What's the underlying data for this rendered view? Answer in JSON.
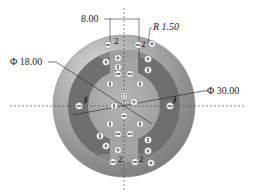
{
  "diagram": {
    "type": "technical-drawing",
    "colors": {
      "outer_disc": "#9a9a9a",
      "outer_disc_highlight": "#d8d8d8",
      "annulus_dark": "#6e6e6e",
      "inner_disc": "#a8a8a8",
      "slot": "#a8a8a8",
      "centerline": "#555555",
      "dimension_line": "#333333",
      "marker_fill": "#f2f2f2"
    },
    "dimensions": {
      "slot_width": "8.00",
      "fillet_radius": "R 1.50",
      "inner_diameter": "Φ 18.00",
      "outer_diameter": "Φ 30.00"
    },
    "labels": {
      "left_region": "1",
      "right_region": "1",
      "top_left_slot": "2",
      "top_right_slot": "2",
      "bottom_left_slot": "2",
      "bottom_right_slot": "2"
    },
    "markers": [
      {
        "x": 108,
        "y": 45,
        "glyph": "minus"
      },
      {
        "x": 138,
        "y": 45,
        "glyph": "minus"
      },
      {
        "x": 152,
        "y": 44,
        "glyph": "dot"
      },
      {
        "x": 106,
        "y": 62,
        "glyph": "dot"
      },
      {
        "x": 118,
        "y": 58,
        "glyph": "dot"
      },
      {
        "x": 148,
        "y": 59,
        "glyph": "dot"
      },
      {
        "x": 118,
        "y": 67,
        "glyph": "bar"
      },
      {
        "x": 148,
        "y": 70,
        "glyph": "bar"
      },
      {
        "x": 118,
        "y": 74,
        "glyph": "minus"
      },
      {
        "x": 130,
        "y": 74,
        "glyph": "minus"
      },
      {
        "x": 110,
        "y": 84,
        "glyph": "bar"
      },
      {
        "x": 140,
        "y": 84,
        "glyph": "bar"
      },
      {
        "x": 124,
        "y": 96,
        "glyph": "square"
      },
      {
        "x": 134,
        "y": 102,
        "glyph": "dot"
      },
      {
        "x": 79,
        "y": 106,
        "glyph": "minus"
      },
      {
        "x": 114,
        "y": 106,
        "glyph": "bar"
      },
      {
        "x": 170,
        "y": 106,
        "glyph": "minus"
      },
      {
        "x": 124,
        "y": 116,
        "glyph": "minus"
      },
      {
        "x": 110,
        "y": 124,
        "glyph": "bar"
      },
      {
        "x": 140,
        "y": 124,
        "glyph": "bar"
      },
      {
        "x": 100,
        "y": 136,
        "glyph": "bar"
      },
      {
        "x": 118,
        "y": 134,
        "glyph": "minus"
      },
      {
        "x": 130,
        "y": 134,
        "glyph": "minus"
      },
      {
        "x": 148,
        "y": 140,
        "glyph": "bar"
      },
      {
        "x": 106,
        "y": 146,
        "glyph": "dot"
      },
      {
        "x": 118,
        "y": 150,
        "glyph": "dot"
      },
      {
        "x": 148,
        "y": 151,
        "glyph": "dot"
      },
      {
        "x": 113,
        "y": 162,
        "glyph": "minus"
      },
      {
        "x": 135,
        "y": 162,
        "glyph": "minus"
      },
      {
        "x": 151,
        "y": 163,
        "glyph": "dot"
      }
    ]
  }
}
